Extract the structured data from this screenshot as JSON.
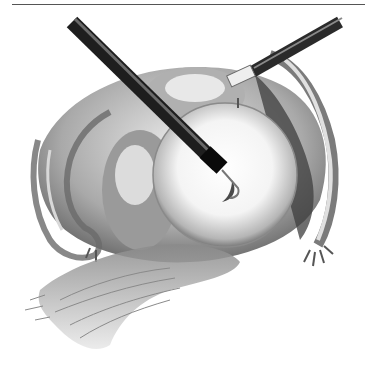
{
  "figure": {
    "palette": {
      "background": "#ffffff",
      "ink_dark": "#2a2a2a",
      "ink_mid": "#7a7a7a",
      "ink_light": "#c8c8c8",
      "rule": "#555555"
    },
    "elements": [
      {
        "name": "laparoscopic-probe-left",
        "type": "instrument"
      },
      {
        "name": "laparoscopic-grasper-right",
        "type": "instrument"
      },
      {
        "name": "spherical-cyst",
        "type": "anatomy"
      },
      {
        "name": "fallopian-tube-left",
        "type": "anatomy"
      },
      {
        "name": "fallopian-tube-right",
        "type": "anatomy"
      },
      {
        "name": "pelvic-floor-tissue",
        "type": "anatomy"
      }
    ]
  }
}
